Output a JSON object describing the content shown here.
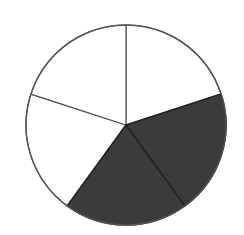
{
  "chart_data": {
    "type": "pie",
    "title": "",
    "slice_count": 5,
    "categories": [
      "Slice 1",
      "Slice 2",
      "Slice 3",
      "Slice 4",
      "Slice 5"
    ],
    "values": [
      1,
      1,
      1,
      1,
      1
    ],
    "shaded": [
      false,
      true,
      true,
      false,
      false
    ],
    "shaded_count": 2,
    "fraction_shaded": "2/5",
    "start_angle_deg": 90,
    "direction": "clockwise",
    "legend": null,
    "colors": {
      "shaded": "#3b3b3b",
      "unshaded": "#ffffff",
      "stroke": "#222222",
      "outline": "#555555"
    },
    "geometry": {
      "cx": 126,
      "cy": 125,
      "r": 100
    }
  }
}
